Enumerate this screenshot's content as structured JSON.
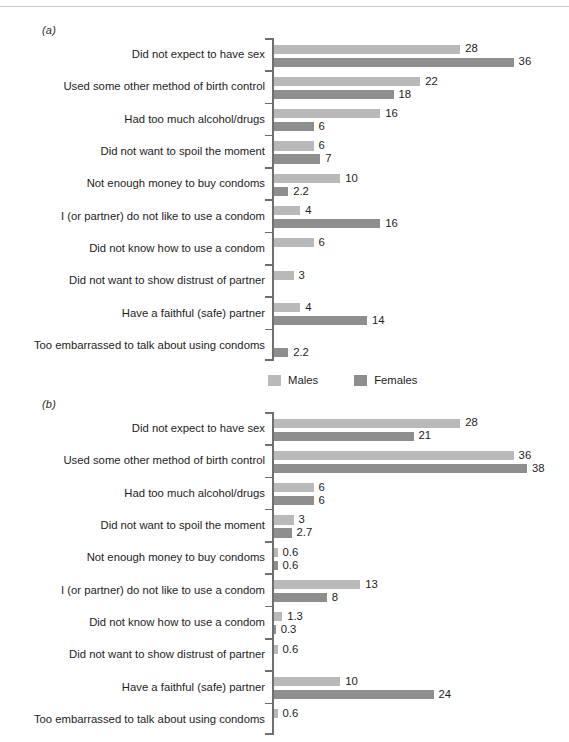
{
  "figure": {
    "panel_a_tag": "(a)",
    "panel_b_tag": "(b)",
    "colors": {
      "males": "#b9b9b9",
      "females": "#8e8e8e",
      "axis": "#6f6f6f",
      "text": "#1d1d1d"
    }
  },
  "legend": {
    "males_label": "Males",
    "females_label": "Females"
  },
  "chart_data": [
    {
      "type": "bar",
      "panel": "(a)",
      "orientation": "horizontal",
      "title": "",
      "xlabel": "",
      "ylabel": "",
      "grid": false,
      "legend_position": "bottom-center",
      "xlim": [
        0,
        40
      ],
      "categories": [
        "Did not expect to have sex",
        "Used some other method of birth control",
        "Had too much alcohol/drugs",
        "Did not want to spoil the moment",
        "Not enough money to buy condoms",
        "I (or partner) do not like to use a condom",
        "Did not know how to use a condom",
        "Did not want to show distrust of partner",
        "Have a faithful (safe) partner",
        "Too embarrassed to talk about using condoms"
      ],
      "series": [
        {
          "name": "Males",
          "color": "#b9b9b9",
          "values": [
            28,
            22,
            16,
            6,
            10,
            4,
            6,
            3,
            4,
            null
          ],
          "labels": [
            "28",
            "22",
            "16",
            "6",
            "10",
            "4",
            "6",
            "3",
            "4",
            ""
          ]
        },
        {
          "name": "Females",
          "color": "#8e8e8e",
          "values": [
            36,
            18,
            6,
            7,
            2.2,
            16,
            null,
            null,
            14,
            2.2
          ],
          "labels": [
            "36",
            "18",
            "6",
            "7",
            "2.2",
            "16",
            "",
            "",
            "14",
            "2.2"
          ]
        }
      ]
    },
    {
      "type": "bar",
      "panel": "(b)",
      "orientation": "horizontal",
      "title": "",
      "xlabel": "",
      "ylabel": "",
      "grid": false,
      "legend_position": "none",
      "xlim": [
        0,
        40
      ],
      "categories": [
        "Did not expect to have sex",
        "Used some other method of birth control",
        "Had too much alcohol/drugs",
        "Did not want to spoil the moment",
        "Not enough money to buy condoms",
        "I (or partner) do not like to use a condom",
        "Did not know how to use a condom",
        "Did not want to show distrust of partner",
        "Have a faithful (safe) partner",
        "Too embarrassed to talk about using condoms"
      ],
      "series": [
        {
          "name": "Males",
          "color": "#b9b9b9",
          "values": [
            28,
            36,
            6,
            3,
            0.6,
            13,
            1.3,
            0.6,
            10,
            0.6
          ],
          "labels": [
            "28",
            "36",
            "6",
            "3",
            "0.6",
            "13",
            "1.3",
            "0.6",
            "10",
            "0.6"
          ]
        },
        {
          "name": "Females",
          "color": "#8e8e8e",
          "values": [
            21,
            38,
            6,
            2.7,
            0.6,
            8,
            0.3,
            null,
            24,
            null
          ],
          "labels": [
            "21",
            "38",
            "6",
            "2.7",
            "0.6",
            "8",
            "0.3",
            "",
            "24",
            ""
          ]
        }
      ]
    }
  ]
}
